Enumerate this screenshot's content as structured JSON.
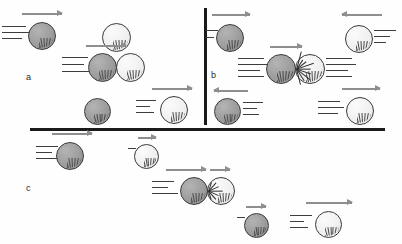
{
  "figure": {
    "background_color": "#fefefe",
    "ball_dark_color": "#9d9d9d",
    "ball_light_color": "#efefef",
    "outline_color": "#3a3a3a",
    "arrow_color": "#8e8e8e",
    "speedline_color": "#3d3d3d",
    "divider_color": "#1a1a1a"
  },
  "dividers": [
    {
      "name": "vertical-divider",
      "orientation": "vertical",
      "x": 204,
      "y": 8,
      "length": 117,
      "thickness": 2.6
    },
    {
      "name": "horizontal-divider",
      "orientation": "horizontal",
      "x": 30,
      "y": 128,
      "length": 355,
      "thickness": 3.2
    }
  ],
  "panels": [
    {
      "id": "a",
      "label": "a",
      "label_x": 26,
      "label_y": 72,
      "scenario": "Moving dark ball strikes a stationary light ball; dark ball stops and light ball moves off",
      "rows": [
        {
          "name": "row-before",
          "balls": [
            {
              "name": "ball-dark-moving-right",
              "shade": "dark",
              "x": 28,
              "y": 22,
              "size": 28,
              "arrow": {
                "dir": "right",
                "x": 22,
                "y": 13,
                "length": 40
              },
              "speedlines": {
                "side": "left",
                "x": 2,
                "y": 26,
                "lengths": [
                  24,
                  30,
                  20
                ],
                "spacing": 6
              }
            },
            {
              "name": "ball-light-at-rest",
              "shade": "light",
              "x": 102,
              "y": 23,
              "size": 29,
              "arrow": null,
              "speedlines": null
            }
          ]
        },
        {
          "name": "row-contact",
          "balls": [
            {
              "name": "ball-dark-in-contact",
              "shade": "dark",
              "x": 88,
              "y": 53,
              "size": 29,
              "arrow": {
                "dir": "right",
                "x": 86,
                "y": 45,
                "length": 40
              },
              "speedlines": {
                "side": "left",
                "x": 62,
                "y": 57,
                "lengths": [
                  26,
                  22,
                  28
                ],
                "spacing": 7
              }
            },
            {
              "name": "ball-light-in-contact",
              "shade": "light",
              "x": 116,
              "y": 53,
              "size": 29,
              "arrow": null,
              "speedlines": null
            }
          ]
        },
        {
          "name": "row-after",
          "balls": [
            {
              "name": "ball-dark-stopped",
              "shade": "dark",
              "x": 84,
              "y": 98,
              "size": 27,
              "arrow": null,
              "speedlines": null
            },
            {
              "name": "ball-light-moving-right",
              "shade": "light",
              "x": 160,
              "y": 96,
              "size": 28,
              "arrow": {
                "dir": "right",
                "x": 152,
                "y": 88,
                "length": 40
              },
              "speedlines": {
                "side": "left",
                "x": 136,
                "y": 100,
                "lengths": [
                  20,
                  14,
                  18
                ],
                "spacing": 6
              }
            }
          ]
        }
      ]
    },
    {
      "id": "b",
      "label": "b",
      "label_x": 211,
      "label_y": 70,
      "scenario": "Head-on collision of two balls moving toward each other; both rebound in opposite directions",
      "rows": [
        {
          "name": "row-before",
          "balls": [
            {
              "name": "ball-dark-moving-right",
              "shade": "dark",
              "x": 216,
              "y": 24,
              "size": 28,
              "arrow": {
                "dir": "right",
                "x": 212,
                "y": 14,
                "length": 38
              },
              "speedlines": {
                "side": "left",
                "x": 206,
                "y": 30,
                "lengths": [
                  12,
                  8
                ],
                "spacing": 7
              }
            },
            {
              "name": "ball-light-moving-left",
              "shade": "light",
              "x": 345,
              "y": 25,
              "size": 28,
              "arrow": {
                "dir": "left",
                "x": 342,
                "y": 14,
                "length": 40
              },
              "speedlines": {
                "side": "right",
                "x": 374,
                "y": 30,
                "lengths": [
                  22,
                  16,
                  12
                ],
                "spacing": 6
              }
            }
          ]
        },
        {
          "name": "row-contact",
          "balls": [
            {
              "name": "ball-dark-in-contact",
              "shade": "dark",
              "x": 266,
              "y": 54,
              "size": 30,
              "arrow": {
                "dir": "right",
                "x": 270,
                "y": 46,
                "length": 32
              },
              "speedlines": {
                "side": "left",
                "x": 238,
                "y": 58,
                "lengths": [
                  26,
                  30,
                  22,
                  26
                ],
                "spacing": 6
              }
            },
            {
              "name": "ball-light-in-contact",
              "shade": "light",
              "x": 295,
              "y": 54,
              "size": 30,
              "arrow": null,
              "speedlines": {
                "side": "right",
                "x": 326,
                "y": 58,
                "lengths": [
                  26,
                  30,
                  22,
                  26
                ],
                "spacing": 6
              }
            }
          ],
          "impact": {
            "name": "impact-starburst",
            "x": 296,
            "y": 69,
            "rays": 9,
            "radius": 18
          }
        },
        {
          "name": "row-after",
          "balls": [
            {
              "name": "ball-dark-rebounding-left",
              "shade": "dark",
              "x": 214,
              "y": 98,
              "size": 27,
              "arrow": {
                "dir": "left",
                "x": 214,
                "y": 90,
                "length": 34
              },
              "speedlines": {
                "side": "right",
                "x": 243,
                "y": 102,
                "lengths": [
                  20,
                  14,
                  16
                ],
                "spacing": 6
              }
            },
            {
              "name": "ball-light-rebounding-right",
              "shade": "light",
              "x": 346,
              "y": 97,
              "size": 28,
              "arrow": {
                "dir": "right",
                "x": 342,
                "y": 88,
                "length": 38
              },
              "speedlines": {
                "side": "left",
                "x": 318,
                "y": 101,
                "lengths": [
                  22,
                  26,
                  20
                ],
                "spacing": 6
              }
            }
          ]
        }
      ]
    },
    {
      "id": "c",
      "label": "c",
      "label_x": 26,
      "label_y": 183,
      "scenario": "Fast dark ball overtakes a slower light ball; after impact the dark ball slows and the light ball speeds up",
      "rows": [
        {
          "name": "row-before",
          "balls": [
            {
              "name": "ball-dark-moving-fast-right",
              "shade": "dark",
              "x": 56,
              "y": 142,
              "size": 28,
              "arrow": {
                "dir": "right",
                "x": 52,
                "y": 133,
                "length": 40
              },
              "speedlines": {
                "side": "left",
                "x": 36,
                "y": 146,
                "lengths": [
                  22,
                  16,
                  26
                ],
                "spacing": 6
              }
            },
            {
              "name": "ball-light-moving-slow-right",
              "shade": "light",
              "x": 134,
              "y": 144,
              "size": 25,
              "arrow": {
                "dir": "right",
                "x": 138,
                "y": 137,
                "length": 18
              },
              "speedlines": {
                "side": "left",
                "x": 128,
                "y": 148,
                "lengths": [
                  8
                ],
                "spacing": 6
              }
            }
          ]
        },
        {
          "name": "row-contact",
          "balls": [
            {
              "name": "ball-dark-in-contact",
              "shade": "dark",
              "x": 180,
              "y": 177,
              "size": 28,
              "arrow": {
                "dir": "right",
                "x": 166,
                "y": 169,
                "length": 40
              },
              "speedlines": {
                "side": "left",
                "x": 152,
                "y": 181,
                "lengths": [
                  22,
                  16,
                  26
                ],
                "spacing": 6
              }
            },
            {
              "name": "ball-light-in-contact",
              "shade": "light",
              "x": 207,
              "y": 177,
              "size": 28,
              "arrow": {
                "dir": "right",
                "x": 210,
                "y": 169,
                "length": 20
              },
              "speedlines": null
            }
          ],
          "impact": {
            "name": "impact-starburst",
            "x": 208,
            "y": 191,
            "rays": 7,
            "radius": 14
          }
        },
        {
          "name": "row-after",
          "balls": [
            {
              "name": "ball-dark-slowed",
              "shade": "dark",
              "x": 244,
              "y": 213,
              "size": 25,
              "arrow": {
                "dir": "right",
                "x": 246,
                "y": 206,
                "length": 20
              },
              "speedlines": {
                "side": "left",
                "x": 237,
                "y": 217,
                "lengths": [
                  8
                ],
                "spacing": 6
              }
            },
            {
              "name": "ball-light-sped-up",
              "shade": "light",
              "x": 315,
              "y": 211,
              "size": 27,
              "arrow": {
                "dir": "right",
                "x": 306,
                "y": 202,
                "length": 46
              },
              "speedlines": {
                "side": "left",
                "x": 290,
                "y": 215,
                "lengths": [
                  22,
                  14,
                  18
                ],
                "spacing": 6
              }
            }
          ]
        }
      ]
    }
  ]
}
